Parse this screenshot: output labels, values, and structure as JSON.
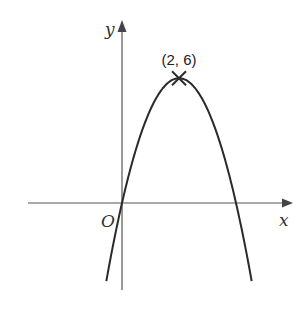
{
  "chart_data": {
    "type": "line",
    "title": "",
    "function": "y = -1.5x^2 + 6x",
    "xlabel": "x",
    "ylabel": "y",
    "origin_label": "O",
    "annotations": [
      {
        "text": "(2, 6)",
        "x": 2,
        "y": 6,
        "marker": "cross"
      }
    ],
    "vertex": {
      "x": 2,
      "y": 6
    },
    "roots": [
      0,
      4
    ],
    "xlim": [
      -3.3,
      6.0
    ],
    "ylim": [
      -4.1,
      8.6
    ],
    "grid": false,
    "curve_range": [
      -0.55,
      4.55
    ]
  },
  "layout": {
    "origin_px": [
      122,
      203
    ],
    "px_per_x": 28.5,
    "px_per_y": 20.8,
    "colors": {
      "axis": "#555555",
      "curve": "#2a2a2a"
    }
  }
}
